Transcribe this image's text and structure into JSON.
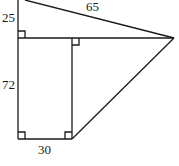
{
  "diagram": {
    "labels": {
      "hypotenuse_top": "65",
      "left_upper": "25",
      "left_lower": "72",
      "bottom": "30"
    },
    "right_angle_markers": 4,
    "colors": {
      "stroke": "#1a1a1a",
      "background": "#ffffff"
    }
  }
}
